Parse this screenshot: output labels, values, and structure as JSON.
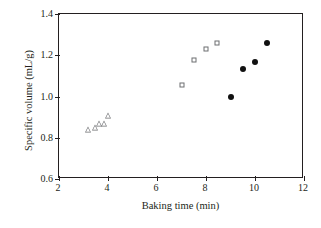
{
  "chart_data": {
    "type": "scatter",
    "title": "",
    "subtitle": "",
    "xlabel": "Baking time (min)",
    "ylabel": "Specific volume (mL/g)",
    "xlim": [
      2,
      12
    ],
    "ylim": [
      0.6,
      1.4
    ],
    "xticks": [
      2,
      4,
      6,
      8,
      10,
      12
    ],
    "yticks": [
      0.6,
      0.8,
      1.0,
      1.2,
      1.4
    ],
    "xtick_labels": [
      "2",
      "4",
      "6",
      "8",
      "10",
      "12"
    ],
    "ytick_labels": [
      "0.6",
      "0.8",
      "1.0",
      "1.2",
      "1.4"
    ],
    "grid": false,
    "legend": "none",
    "series": [
      {
        "name": "open-triangle-series",
        "marker": "open-triangle",
        "color": "#6d6e71",
        "points": [
          {
            "x": 3.2,
            "y": 0.84
          },
          {
            "x": 3.45,
            "y": 0.848
          },
          {
            "x": 3.65,
            "y": 0.865
          },
          {
            "x": 3.85,
            "y": 0.868
          },
          {
            "x": 4.0,
            "y": 0.905
          }
        ]
      },
      {
        "name": "open-square-series",
        "marker": "open-square",
        "color": "#6d6e71",
        "points": [
          {
            "x": 7.0,
            "y": 1.058
          },
          {
            "x": 7.5,
            "y": 1.177
          },
          {
            "x": 8.0,
            "y": 1.23
          },
          {
            "x": 8.45,
            "y": 1.26
          }
        ]
      },
      {
        "name": "filled-circle-series",
        "marker": "filled-circle",
        "color": "#111111",
        "points": [
          {
            "x": 9.0,
            "y": 0.997
          },
          {
            "x": 9.5,
            "y": 1.135
          },
          {
            "x": 10.0,
            "y": 1.165
          },
          {
            "x": 10.5,
            "y": 1.26
          }
        ]
      }
    ]
  }
}
